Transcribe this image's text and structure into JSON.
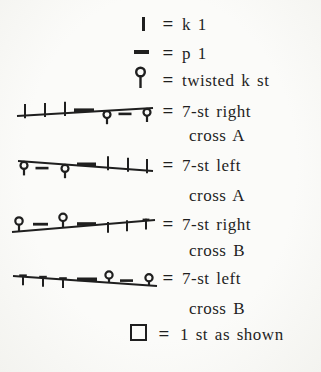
{
  "page": {
    "paper": "#f9f9f7",
    "ink": "#1f1f1f"
  },
  "legend": {
    "equals": "=",
    "rows": [
      {
        "symbol": "knit-stitch-bar",
        "label": "k 1"
      },
      {
        "symbol": "purl-stitch-dash",
        "label": "p 1"
      },
      {
        "symbol": "twisted-knit-stitch",
        "label": "twisted k st"
      },
      {
        "symbol": "cable-7st-right-cross-a",
        "label": "7-st right",
        "label2": "cross A"
      },
      {
        "symbol": "cable-7st-left-cross-a",
        "label": "7-st left",
        "label2": "cross A"
      },
      {
        "symbol": "cable-7st-right-cross-b",
        "label": "7-st right",
        "label2": "cross B"
      },
      {
        "symbol": "cable-7st-left-cross-b",
        "label": "7-st left",
        "label2": "cross B"
      },
      {
        "symbol": "stitch-as-shown-box",
        "label": "1 st as shown"
      }
    ]
  }
}
